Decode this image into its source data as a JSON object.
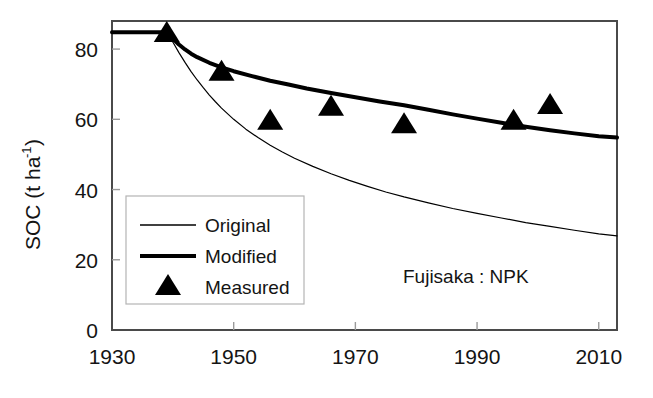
{
  "chart_data": {
    "type": "line",
    "title": "",
    "subtitle": "",
    "xlabel": "",
    "ylabel": "SOC (t ha",
    "ylabel_sup": "-1",
    "ylabel_tail": ")",
    "annotation": "Fujisaka : NPK",
    "xlim": [
      1930,
      2013
    ],
    "ylim": [
      0,
      88
    ],
    "xticks": [
      1930,
      1950,
      1970,
      1990,
      2010
    ],
    "xtick_labels": [
      "1930",
      "1950",
      "1970",
      "1990",
      "2010"
    ],
    "yticks": [
      0,
      20,
      40,
      60,
      80
    ],
    "ytick_labels": [
      "0",
      "20",
      "40",
      "60",
      "80"
    ],
    "grid": false,
    "legend_position": "lower-left-inside",
    "legend": [
      {
        "label": "Original",
        "marker": "thin-line",
        "color": "#000000"
      },
      {
        "label": "Modified",
        "marker": "thick-line",
        "color": "#000000"
      },
      {
        "label": "Measured",
        "marker": "triangle",
        "color": "#000000"
      }
    ],
    "series": [
      {
        "name": "Original",
        "style": "thin-line",
        "color": "#000000",
        "linewidth": 1.2,
        "x": [
          1930,
          1934,
          1939,
          1940,
          1941,
          1942,
          1943,
          1944,
          1945,
          1946,
          1947,
          1948,
          1950,
          1952,
          1954,
          1956,
          1958,
          1960,
          1963,
          1966,
          1969,
          1972,
          1975,
          1978,
          1982,
          1986,
          1990,
          1994,
          1998,
          2002,
          2006,
          2010,
          2013
        ],
        "y": [
          84.8,
          84.8,
          84.8,
          82.0,
          79.0,
          76.2,
          73.6,
          71.2,
          69.0,
          66.9,
          65.0,
          63.2,
          60.0,
          57.2,
          54.8,
          52.6,
          50.7,
          48.9,
          46.6,
          44.5,
          42.6,
          40.9,
          39.3,
          37.9,
          36.2,
          34.6,
          33.2,
          31.9,
          30.6,
          29.5,
          28.4,
          27.4,
          26.8
        ]
      },
      {
        "name": "Modified",
        "style": "thick-line",
        "color": "#000000",
        "linewidth": 4.0,
        "x": [
          1930,
          1934,
          1939,
          1940,
          1941,
          1942,
          1943,
          1944,
          1946,
          1948,
          1950,
          1953,
          1956,
          1959,
          1962,
          1966,
          1970,
          1974,
          1978,
          1982,
          1986,
          1990,
          1994,
          1998,
          2002,
          2006,
          2010,
          2013
        ],
        "y": [
          84.8,
          84.8,
          84.8,
          83.0,
          81.3,
          79.9,
          78.7,
          77.7,
          76.1,
          74.8,
          73.7,
          72.3,
          71.0,
          69.9,
          68.8,
          67.5,
          66.3,
          65.1,
          64.0,
          62.7,
          61.4,
          60.2,
          59.0,
          57.9,
          56.9,
          56.0,
          55.2,
          54.8
        ]
      }
    ],
    "points": {
      "name": "Measured",
      "marker": "triangle",
      "color": "#000000",
      "data": [
        {
          "x": 1939,
          "y": 85.0
        },
        {
          "x": 1948,
          "y": 74.0
        },
        {
          "x": 1956,
          "y": 60.0
        },
        {
          "x": 1966,
          "y": 64.0
        },
        {
          "x": 1978,
          "y": 59.0
        },
        {
          "x": 1996,
          "y": 60.0
        },
        {
          "x": 2002,
          "y": 64.5
        }
      ]
    }
  }
}
